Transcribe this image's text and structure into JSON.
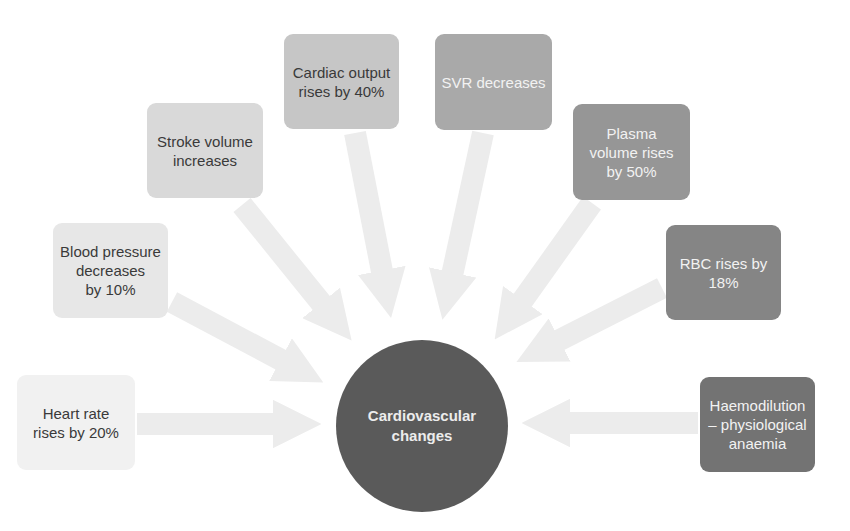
{
  "diagram": {
    "hub": {
      "label_line1": "Cardiovascular",
      "label_line2": "changes",
      "color": "#5a5a5a"
    },
    "nodes": [
      {
        "id": "heart-rate",
        "lines": [
          "Heart rate",
          "rises by 20%"
        ],
        "fill": "#f1f1f1",
        "text_color": "#3a3a3a"
      },
      {
        "id": "blood-pressure",
        "lines": [
          "Blood pressure",
          "decreases",
          "by 10%"
        ],
        "fill": "#e7e7e7",
        "text_color": "#3a3a3a"
      },
      {
        "id": "stroke-volume",
        "lines": [
          "Stroke volume",
          "increases"
        ],
        "fill": "#d9d9d9",
        "text_color": "#3a3a3a"
      },
      {
        "id": "cardiac-output",
        "lines": [
          "Cardiac output",
          "rises by 40%"
        ],
        "fill": "#c6c6c6",
        "text_color": "#3a3a3a"
      },
      {
        "id": "svr",
        "lines": [
          "SVR decreases"
        ],
        "fill": "#a9a9a9",
        "text_color": "#f2f2f2"
      },
      {
        "id": "plasma-volume",
        "lines": [
          "Plasma",
          "volume rises",
          "by 50%"
        ],
        "fill": "#969696",
        "text_color": "#f2f2f2"
      },
      {
        "id": "rbc",
        "lines": [
          "RBC rises by",
          "18%"
        ],
        "fill": "#858585",
        "text_color": "#f2f2f2"
      },
      {
        "id": "haemodilution",
        "lines": [
          "Haemodilution",
          "– physiological",
          "anaemia"
        ],
        "fill": "#737373",
        "text_color": "#f2f2f2"
      }
    ],
    "arrow_color": "#ececec"
  }
}
